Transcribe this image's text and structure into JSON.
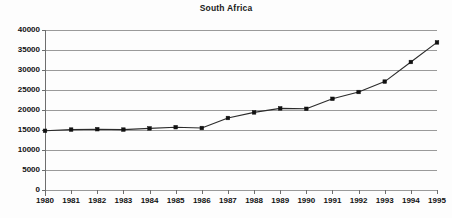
{
  "chart_data": {
    "type": "line",
    "title": "South Africa",
    "xlabel": "",
    "ylabel": "",
    "categories": [
      "1980",
      "1981",
      "1982",
      "1983",
      "1984",
      "1985",
      "1986",
      "1987",
      "1988",
      "1989",
      "1990",
      "1991",
      "1992",
      "1993",
      "1994",
      "1995"
    ],
    "x": [
      1980,
      1981,
      1982,
      1983,
      1984,
      1985,
      1986,
      1987,
      1988,
      1989,
      1990,
      1991,
      1992,
      1993,
      1994,
      1995
    ],
    "values": [
      14800,
      15100,
      15200,
      15100,
      15400,
      15700,
      15500,
      18000,
      19400,
      20400,
      20300,
      22800,
      24500,
      27100,
      32000,
      36900
    ],
    "series": [
      {
        "name": "South Africa",
        "values": [
          14800,
          15100,
          15200,
          15100,
          15400,
          15700,
          15500,
          18000,
          19400,
          20400,
          20300,
          22800,
          24500,
          27100,
          32000,
          36900
        ]
      }
    ],
    "ylim": [
      0,
      40000
    ],
    "ytick_values": [
      0,
      5000,
      10000,
      15000,
      20000,
      25000,
      30000,
      35000,
      40000
    ],
    "ytick_labels": [
      "0",
      "5000",
      "10000",
      "15000",
      "20000",
      "25000",
      "30000",
      "35000",
      "40000"
    ],
    "xtick_labels": [
      "1980",
      "1981",
      "1982",
      "1983",
      "1984",
      "1985",
      "1986",
      "1987",
      "1988",
      "1989",
      "1990",
      "1991",
      "1992",
      "1993",
      "1994",
      "1995"
    ],
    "grid": true,
    "grid_axis": "y",
    "legend": false,
    "legend_position": "none",
    "marker": "square",
    "line_color": "#2b2b2b",
    "marker_color": "#111111",
    "grid_color": "#9a9a9a",
    "axis_color": "#6e6e6e",
    "background_color": "#fdfdfd"
  }
}
